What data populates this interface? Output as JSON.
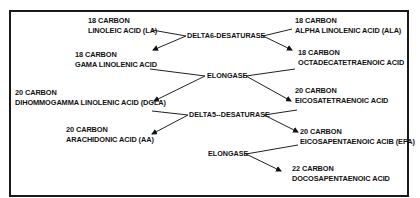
{
  "diagram": {
    "nodes": {
      "la": {
        "carbon": "18 CARBON",
        "name": "LINOLEIC ACID (LA)"
      },
      "ala": {
        "carbon": "18 CARBON",
        "name": "ALPHA LINOLENIC ACID (ALA)"
      },
      "gla": {
        "carbon": "18 CARBON",
        "name": "GAMA LINOLENIC ACID"
      },
      "sda": {
        "carbon": "18 CARBON",
        "name": "OCTADECATETRAENOIC ACID"
      },
      "dgla": {
        "carbon": "20 CARBON",
        "name": "DIHOMMOGAMMA LINOLENIC ACID (DGLA)"
      },
      "eta": {
        "carbon": "20 CARBON",
        "name": "EICOSATETRAENOIC ACID"
      },
      "aa": {
        "carbon": "20 CARBON",
        "name": "ARACHIDONIC ACID (AA)"
      },
      "epa": {
        "carbon": "20 CARBON",
        "name": "EICOSAPENTAENOIC ACIB (EPA)"
      },
      "dpa": {
        "carbon": "22 CARBON",
        "name": "DOCOSAPENTAENOIC ACID"
      }
    },
    "enzymes": {
      "delta6": "DELTA6-DESATURASE",
      "elongase1": "ELONGASE",
      "delta5": "DELTA5--DESATURASE",
      "elongase2": "ELONGASE"
    },
    "edges": [
      {
        "from": "la",
        "via": "delta6",
        "to": "gla"
      },
      {
        "from": "ala",
        "via": "delta6",
        "to": "sda"
      },
      {
        "from": "gla",
        "via": "elongase1",
        "to": "dgla"
      },
      {
        "from": "sda",
        "via": "elongase1",
        "to": "eta"
      },
      {
        "from": "dgla",
        "via": "delta5",
        "to": "aa"
      },
      {
        "from": "eta",
        "via": "delta5",
        "to": "epa"
      },
      {
        "from": "epa",
        "via": "elongase2",
        "to": "dpa"
      }
    ],
    "colors": {
      "ink": "#111111",
      "background": "#ffffff",
      "border": "#1a1a1a"
    }
  }
}
